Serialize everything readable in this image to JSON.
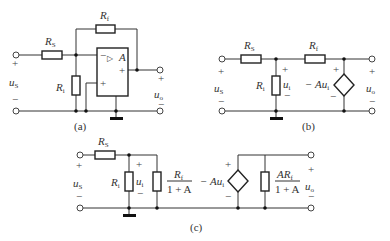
{
  "figure": {
    "captions": {
      "a": "(a)",
      "b": "(b)",
      "c": "(c)"
    },
    "labels": {
      "Rs_main": "R",
      "Rs_sub": "S",
      "Rf_main": "R",
      "Rf_sub": "f",
      "Ri_main": "R",
      "Ri_sub": "i",
      "us_main": "u",
      "us_sub": "S",
      "uo_main": "u",
      "uo_sub": "o",
      "ui_main": "u",
      "ui_sub": "i",
      "amp": "A",
      "dep_source": "− Au",
      "dep_source_sub": "i",
      "frac1_num_main": "R",
      "frac1_num_sub": "f",
      "frac1_den": "1 + A",
      "frac2_num_main": "AR",
      "frac2_num_sub": "f",
      "frac2_den": "1 + A",
      "plus": "+",
      "minus": "−",
      "opamp_triangle": "▷"
    },
    "colors": {
      "wire": "#333333",
      "background": "#ffffff"
    }
  }
}
